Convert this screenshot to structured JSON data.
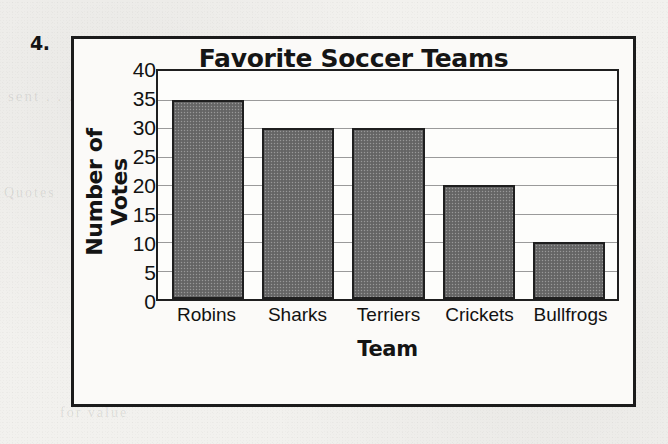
{
  "problem": {
    "number": "4."
  },
  "chart_data": {
    "type": "bar",
    "title": "Favorite Soccer Teams",
    "xlabel": "Team",
    "ylabel": "Number of Votes",
    "categories": [
      "Robins",
      "Sharks",
      "Terriers",
      "Crickets",
      "Bullfrogs"
    ],
    "values": [
      35,
      30,
      30,
      20,
      10
    ],
    "ylim": [
      0,
      40
    ],
    "ytick_step": 5,
    "yticks": [
      0,
      5,
      10,
      15,
      20,
      25,
      30,
      35,
      40
    ],
    "ytick_labels": [
      "0",
      "5",
      "10",
      "15",
      "20",
      "25",
      "30",
      "35",
      "40"
    ],
    "grid": true,
    "grid_axis": "y",
    "legend": false,
    "bar_fill_color": "#6b6b6b",
    "bar_edge_color": "#1f1f1f",
    "plot_background": "#fdfdfb",
    "frame_color": "#1b1b1b"
  },
  "page_background": {
    "bleed_through_text": [
      "sent . . .",
      "Quotes",
      "the num . . .",
      "for value",
      "Chapter"
    ]
  }
}
